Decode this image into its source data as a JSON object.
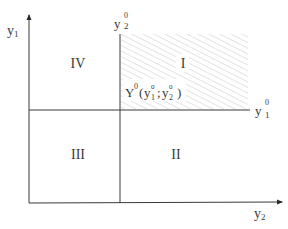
{
  "diagram": {
    "type": "quadrant-partition",
    "axes": {
      "vertical_axis_label": "y",
      "vertical_axis_subscript": "1",
      "horizontal_axis_label": "y",
      "horizontal_axis_subscript": "2"
    },
    "reference_lines": {
      "vertical_line_label": "y",
      "vertical_line_superscript": "0",
      "vertical_line_subscript": "2",
      "horizontal_line_label": "y",
      "horizontal_line_superscript": "0",
      "horizontal_line_subscript": "1"
    },
    "quadrants": [
      {
        "id": "I",
        "label": "I",
        "hatched": true
      },
      {
        "id": "II",
        "label": "II",
        "hatched": false
      },
      {
        "id": "III",
        "label": "III",
        "hatched": false
      },
      {
        "id": "IV",
        "label": "IV",
        "hatched": false
      }
    ],
    "point": {
      "label_main": "Y",
      "label_sup": "0",
      "open_paren": "(",
      "y1": "y",
      "y1_sup": "0",
      "y1_sub": "1",
      "separator": ";",
      "y2": "y",
      "y2_sup": "0",
      "y2_sub": "2",
      "close_paren": ")"
    },
    "colors": {
      "line": "#3a3a3a",
      "hatch": "#c8c8c8",
      "text": "#3a3a3a"
    }
  }
}
